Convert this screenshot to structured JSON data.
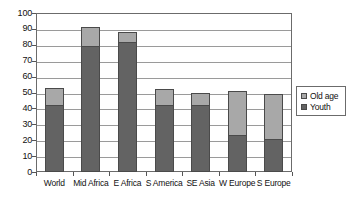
{
  "chart_data": {
    "type": "bar",
    "title": "",
    "xlabel": "",
    "ylabel": "",
    "stacked": true,
    "grid": true,
    "legend_position": "right",
    "ylim": [
      0,
      100
    ],
    "ytick_step": 10,
    "yticks": [
      "0",
      "10",
      "20",
      "30",
      "40",
      "50",
      "60",
      "70",
      "80",
      "90",
      "100"
    ],
    "categories": [
      "World",
      "Mid Africa",
      "E Africa",
      "S America",
      "SE Asia",
      "W Europe",
      "S Europe"
    ],
    "series": [
      {
        "name": "Youth",
        "color": "#636363",
        "values": [
          42,
          79,
          82,
          42,
          42,
          23,
          21
        ]
      },
      {
        "name": "Old age",
        "color": "#a8a8a8",
        "values": [
          11,
          12,
          6,
          10,
          8,
          28,
          28
        ]
      }
    ],
    "totals": [
      53,
      91,
      88,
      52,
      50,
      51,
      49
    ]
  },
  "legend": {
    "items": [
      {
        "label": "Old age",
        "swatch": "legend-swatch-old-age"
      },
      {
        "label": "Youth",
        "swatch": "legend-swatch-youth"
      }
    ]
  },
  "colors": {
    "old_age": "#a8a8a8",
    "youth": "#636363",
    "axis": "#6b6b6b",
    "grid": "#9a9a9a",
    "background": "#ffffff"
  }
}
